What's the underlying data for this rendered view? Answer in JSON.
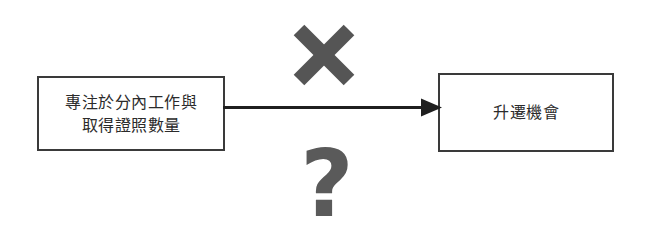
{
  "diagram": {
    "title": "",
    "background_color": "#ffffff",
    "nodes": [
      {
        "id": "cause",
        "lines": [
          "專注於分內工作與",
          "取得證照數量"
        ],
        "border_color": "#3a3a3a",
        "text_color": "#2b2b2b",
        "fill_color": "#ffffff"
      },
      {
        "id": "effect",
        "lines": [
          "升遷機會"
        ],
        "border_color": "#3a3a3a",
        "text_color": "#2b2b2b",
        "fill_color": "#ffffff"
      }
    ],
    "connector": {
      "type": "arrow",
      "direction": "left-to-right",
      "from": "cause",
      "to": "effect",
      "color": "#1f1f1f",
      "label": ""
    },
    "annotations": [
      {
        "id": "cross",
        "icon": "cross-mark-icon",
        "glyph": "✕",
        "color": "#555555",
        "position": "above-arrow"
      },
      {
        "id": "question",
        "icon": "question-mark-icon",
        "glyph": "?",
        "color": "#5a5a5a",
        "position": "below-arrow"
      }
    ]
  }
}
